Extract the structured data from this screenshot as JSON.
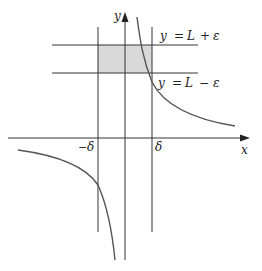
{
  "diagram": {
    "type": "epsilon-delta limit illustration",
    "axes": {
      "x_label": "x",
      "y_label": "y"
    },
    "horizontal_lines": [
      {
        "id": "upper",
        "label": "y = L + ε",
        "parts": [
          "y",
          "=",
          "L",
          "+",
          "ε"
        ]
      },
      {
        "id": "lower",
        "label": "y = L − ε",
        "parts": [
          "y",
          "=",
          "L",
          "−",
          "ε"
        ]
      }
    ],
    "vertical_lines": [
      {
        "id": "neg-delta",
        "label": "− δ",
        "sign": "−",
        "symbol": "δ"
      },
      {
        "id": "pos-delta",
        "label": "δ",
        "symbol": "δ"
      }
    ],
    "shaded_region": {
      "description": "rectangle between x = −δ and x = δ, y = L − ε and y = L + ε",
      "color": "#d9d9d9"
    },
    "curves": [
      {
        "id": "right-branch",
        "description": "decreasing curve from top near y-axis toward x-axis on right"
      },
      {
        "id": "left-branch",
        "description": "decreasing curve from left going down to negative infinity near y-axis"
      }
    ],
    "colors": {
      "line": "#333333",
      "curve": "#555555",
      "shade": "#d9d9d9"
    }
  }
}
